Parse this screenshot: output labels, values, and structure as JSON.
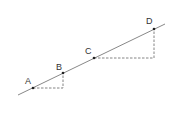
{
  "diagram": {
    "type": "line-with-points",
    "colors": {
      "line": "#888888",
      "point": "#222222",
      "dashed": "#666666",
      "label": "#333333"
    },
    "main_line": {
      "x1": 18,
      "y1": 95,
      "x2": 165,
      "y2": 24
    },
    "points": [
      {
        "label": "A",
        "x": 33,
        "y": 88,
        "lx": 25,
        "ly": 77
      },
      {
        "label": "B",
        "x": 63,
        "y": 73,
        "lx": 56,
        "ly": 63
      },
      {
        "label": "C",
        "x": 94,
        "y": 58,
        "lx": 85,
        "ly": 47
      },
      {
        "label": "D",
        "x": 154,
        "y": 29,
        "lx": 146,
        "ly": 17
      }
    ],
    "dashed_triangles": [
      {
        "from": "A",
        "to": "B",
        "corner": {
          "x": 63,
          "y": 88
        }
      },
      {
        "from": "C",
        "to": "D",
        "corner": {
          "x": 154,
          "y": 58
        }
      }
    ]
  }
}
